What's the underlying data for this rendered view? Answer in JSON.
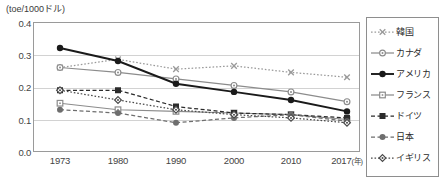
{
  "chart_data": {
    "type": "line",
    "title": "",
    "subtitle": "",
    "ylabel": "(toe/1000ドル)",
    "xlabel": "(年)",
    "categories": [
      "1973",
      "1980",
      "1990",
      "2000",
      "2010",
      "2017"
    ],
    "x_axis_unit": "(年)",
    "yticks": [
      "0.0",
      "0.1",
      "0.2",
      "0.3",
      "0.4"
    ],
    "ylim": [
      0.0,
      0.4
    ],
    "grid": true,
    "legend_position": "right",
    "series": [
      {
        "name": "韓国",
        "marker": "x",
        "line_style": "dotted",
        "color": "#9a9a9a",
        "values": [
          0.26,
          0.285,
          0.255,
          0.265,
          0.245,
          0.23
        ]
      },
      {
        "name": "カナダ",
        "marker": "open-circle",
        "line_style": "solid",
        "color": "#8c8c8c",
        "values": [
          0.26,
          0.245,
          0.225,
          0.205,
          0.185,
          0.155
        ]
      },
      {
        "name": "アメリカ",
        "marker": "filled-circle",
        "line_style": "solid",
        "color": "#1a1a1a",
        "values": [
          0.32,
          0.28,
          0.21,
          0.185,
          0.16,
          0.125
        ]
      },
      {
        "name": "フランス",
        "marker": "open-square",
        "line_style": "solid",
        "color": "#8c8c8c",
        "values": [
          0.15,
          0.13,
          0.125,
          0.12,
          0.115,
          0.1
        ]
      },
      {
        "name": "ドイツ",
        "marker": "filled-square",
        "line_style": "dashed",
        "color": "#2b2b2b",
        "values": [
          0.19,
          0.19,
          0.14,
          0.12,
          0.115,
          0.105
        ]
      },
      {
        "name": "日本",
        "marker": "filled-circle-gray",
        "line_style": "dashed",
        "color": "#6e6e6e",
        "values": [
          0.13,
          0.12,
          0.09,
          0.105,
          0.115,
          0.095
        ]
      },
      {
        "name": "イギリス",
        "marker": "open-diamond",
        "line_style": "dotted",
        "color": "#4a4a4a",
        "values": [
          0.19,
          0.16,
          0.13,
          0.115,
          0.105,
          0.09
        ]
      }
    ]
  },
  "axis": {
    "unit_caption": "(toe/1000ドル)"
  },
  "legend": {
    "items": [
      {
        "label": "韓国"
      },
      {
        "label": "カナダ"
      },
      {
        "label": "アメリカ"
      },
      {
        "label": "フランス"
      },
      {
        "label": "ドイツ"
      },
      {
        "label": "日本"
      },
      {
        "label": "イギリス"
      }
    ]
  }
}
